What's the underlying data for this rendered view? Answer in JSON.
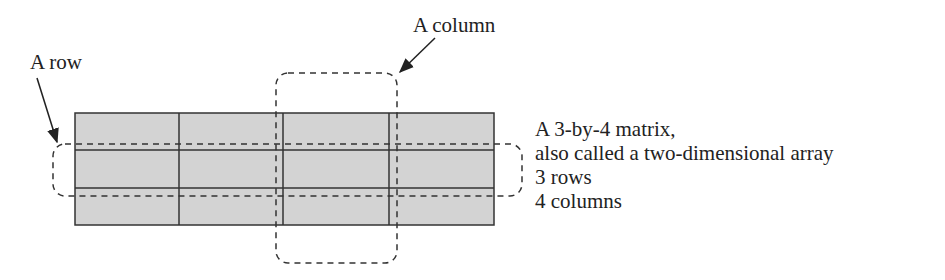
{
  "labels": {
    "row": "A row",
    "column": "A column"
  },
  "description": {
    "lines": [
      "A 3-by-4 matrix,",
      "also called a two-dimensional array",
      "3 rows",
      "4 columns"
    ]
  },
  "matrix": {
    "rows": 3,
    "columns": 4,
    "fill": "#d3d3d3",
    "stroke": "#333333"
  }
}
